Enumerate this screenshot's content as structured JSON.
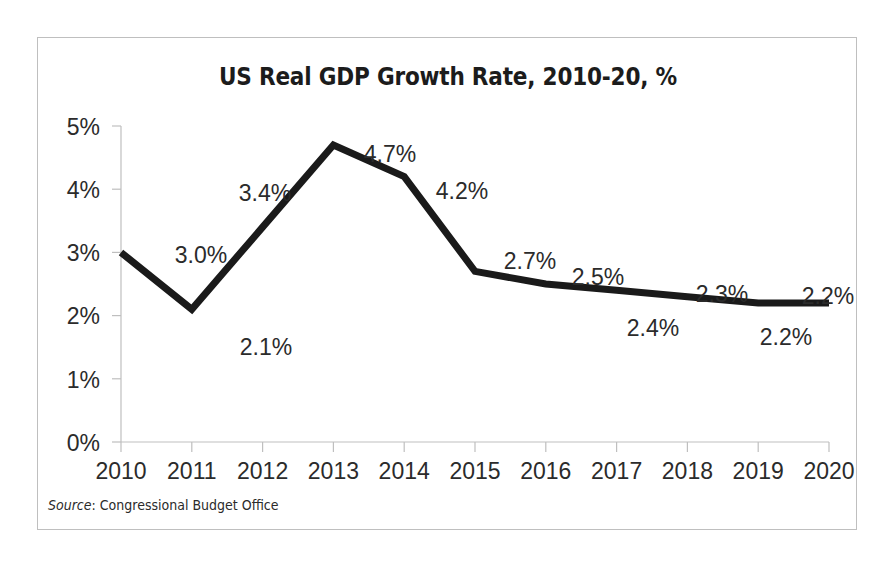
{
  "chart_data": {
    "type": "line",
    "title": "US Real GDP Growth Rate, 2010-20, %",
    "xlabel": "",
    "ylabel": "",
    "categories": [
      "2010",
      "2011",
      "2012",
      "2013",
      "2014",
      "2015",
      "2016",
      "2017",
      "2018",
      "2019",
      "2020"
    ],
    "values": [
      3.0,
      2.1,
      3.4,
      4.7,
      4.2,
      2.7,
      2.5,
      2.4,
      2.3,
      2.2,
      2.2
    ],
    "data_labels": [
      "3.0%",
      "2.1%",
      "3.4%",
      "4.7%",
      "4.2%",
      "2.7%",
      "2.5%",
      "2.4%",
      "2.3%",
      "2.2%",
      "2.2%"
    ],
    "label_positions": [
      "right",
      "below-right",
      "above-left",
      "right",
      "right",
      "above-right",
      "above-right",
      "below",
      "above",
      "below",
      "right"
    ],
    "ylim": [
      0,
      5
    ],
    "yticks": [
      0,
      1,
      2,
      3,
      4,
      5
    ],
    "ytick_labels": [
      "0%",
      "1%",
      "2%",
      "3%",
      "4%",
      "5%"
    ],
    "grid": false,
    "legend": false,
    "series_color": "#1a1a1a",
    "line_width": 7,
    "axis_color": "#bfbfbf"
  },
  "source": {
    "label": "Source",
    "separator": ": ",
    "text": "Congressional Budget Office"
  },
  "colors": {
    "frame": "#bfbfbf",
    "text": "#2b2b2b",
    "title": "#1c1c1c",
    "line": "#1a1a1a",
    "background": "#ffffff"
  }
}
